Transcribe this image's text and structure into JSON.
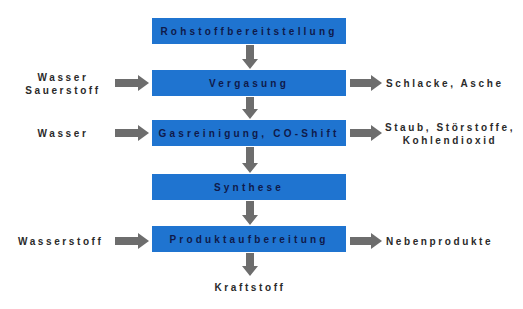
{
  "colors": {
    "box_fill": "#1f74d0",
    "box_text": "#0f1a4a",
    "arrow": "#6d6d6d",
    "label_text": "#2a2a2a"
  },
  "process_steps": [
    {
      "label": "Rohstoffbereitstellung"
    },
    {
      "label": "Vergasung"
    },
    {
      "label": "Gasreinigung, CO-Shift"
    },
    {
      "label": "Synthese"
    },
    {
      "label": "Produktaufbereitung"
    }
  ],
  "inputs": [
    {
      "step": "Vergasung",
      "lines": [
        "Wasser",
        "Sauerstoff"
      ]
    },
    {
      "step": "Gasreinigung, CO-Shift",
      "lines": [
        "Wasser"
      ]
    },
    {
      "step": "Produktaufbereitung",
      "lines": [
        "Wasserstoff"
      ]
    }
  ],
  "outputs": [
    {
      "step": "Vergasung",
      "lines": [
        "Schlacke, Asche"
      ]
    },
    {
      "step": "Gasreinigung, CO-Shift",
      "lines": [
        "Staub, Störstoffe,",
        "Kohlendioxid"
      ]
    },
    {
      "step": "Produktaufbereitung",
      "lines": [
        "Nebenprodukte"
      ]
    }
  ],
  "final_product": {
    "label": "Kraftstoff"
  }
}
